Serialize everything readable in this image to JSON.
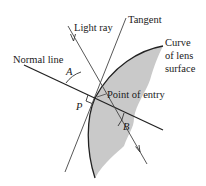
{
  "diagram": {
    "labels": {
      "light_ray": "Light ray",
      "tangent": "Tangent",
      "normal_line": "Normal line",
      "curve_line1": "Curve",
      "curve_line2": "of lens",
      "curve_line3": "surface",
      "point_of_entry": "Point of entry",
      "angle_a": "A",
      "angle_b": "B",
      "point_p": "P"
    },
    "colors": {
      "lens_fill": "#c9c9c9",
      "line": "#2a2a2a",
      "background": "#ffffff"
    }
  }
}
